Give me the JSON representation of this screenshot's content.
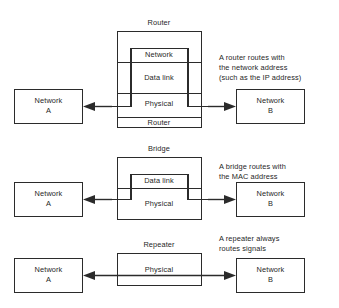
{
  "figure": {
    "background_color": "#ffffff",
    "line_color": "#2b2b2b",
    "text_color": "#1f1f1f"
  },
  "sections": [
    {
      "id": "router",
      "device_title": "Router",
      "device_footer": "Router",
      "layers": [
        "Network",
        "Data link",
        "Physical"
      ],
      "left_node": {
        "line1": "Network",
        "line2": "A"
      },
      "right_node": {
        "line1": "Network",
        "line2": "B"
      },
      "note": "A router routes with\nthe network address\n(such as the IP address)"
    },
    {
      "id": "bridge",
      "device_title": "Bridge",
      "device_footer": "",
      "layers": [
        "Data link",
        "Physical"
      ],
      "left_node": {
        "line1": "Network",
        "line2": "A"
      },
      "right_node": {
        "line1": "Network",
        "line2": "B"
      },
      "note": "A bridge routes with\nthe MAC address"
    },
    {
      "id": "repeater",
      "device_title": "Repeater",
      "device_footer": "",
      "layers": [
        "Physical"
      ],
      "left_node": {
        "line1": "Network",
        "line2": "A"
      },
      "right_node": {
        "line1": "Network",
        "line2": "B"
      },
      "note": "A repeater always\nroutes signals"
    }
  ]
}
